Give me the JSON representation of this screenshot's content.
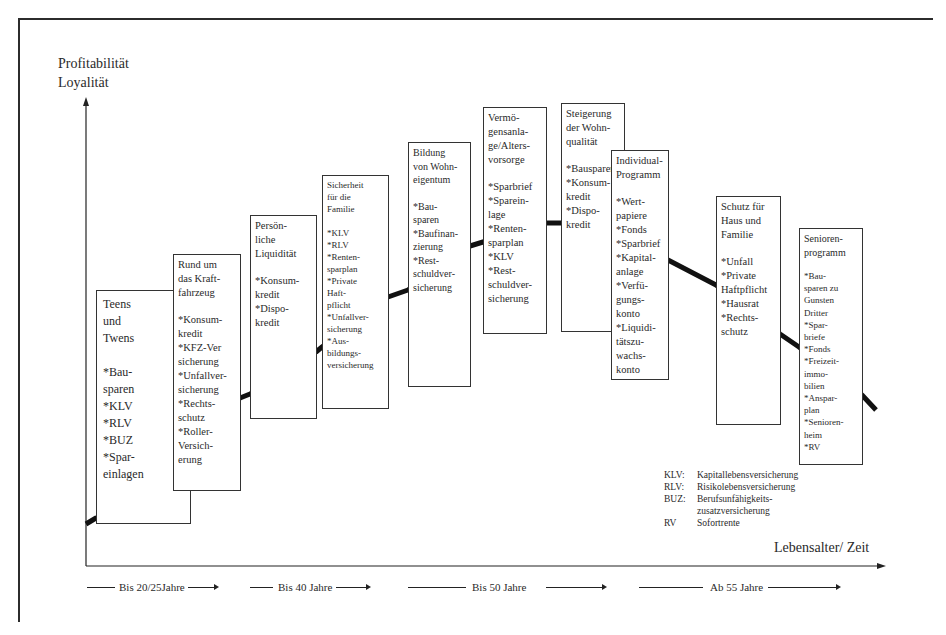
{
  "axes": {
    "y_label_line1": "Profitabilität",
    "y_label_line2": "Loyalität",
    "x_label": "Lebensalter/ Zeit"
  },
  "boxes": [
    {
      "title": "Teens\nund\nTwens",
      "items": [
        "*Bau-\n sparen",
        "*KLV",
        "*RLV",
        "*BUZ",
        "*Spar-\n einlagen"
      ]
    },
    {
      "title": "Rund um\ndas Kraft-\nfahrzeug",
      "items": [
        "*Konsum-\n kredit",
        "*KFZ-Ver\n sicherung",
        "*Unfallver-\n sicherung",
        "*Rechts-\n schutz",
        "*Roller-\n Versich-\n erung"
      ]
    },
    {
      "title": "Persön-\nliche\nLiquidität",
      "items": [
        "*Konsum-\n kredit",
        "*Dispo-\n kredit"
      ]
    },
    {
      "title": "Sicherheit\nfür die\nFamilie",
      "items": [
        "*KLV",
        "*RLV",
        "*Renten-\n sparplan",
        "*Private\n Haft-\n pflicht",
        "*Unfallver-\n sicherung",
        "*Aus-\n bildungs-\n versicherung"
      ]
    },
    {
      "title": "Bildung\nvon Wohn-\neigentum",
      "items": [
        "*Bau-\n sparen",
        "*Baufinan-\n zierung",
        "*Rest-\n schuldver-\n sicherung"
      ]
    },
    {
      "title": "Vermö-\ngensanla-\nge/Alters-\nvorsorge",
      "items": [
        "*Sparbrief",
        "*Sparein-\n lage",
        "*Renten-\n sparplan",
        "*KLV",
        "*Rest-\n schuldver-\n sicherung"
      ]
    },
    {
      "title": "Steigerung\nder Wohn-\nqualität",
      "items": [
        "*Bausparen",
        "*Konsum-\n kredit",
        "*Dispo-\n kredit"
      ]
    },
    {
      "title": "Individual-\nProgramm",
      "items": [
        "*Wert-\n papiere",
        "*Fonds",
        "*Sparbrief",
        "*Kapital-\n anlage",
        "*Verfü-\n gungs-\n konto",
        "*Liquidi-\n tätszu-\n wachs-\n konto"
      ]
    },
    {
      "title": "Schutz für\nHaus und\nFamilie",
      "items": [
        "*Unfall",
        "*Private\n Haftpflicht",
        "*Hausrat",
        "*Rechts-\n schutz"
      ]
    },
    {
      "title": "Senioren-\nprogramm",
      "items": [
        "*Bau-\n sparen zu\n Gunsten\n Dritter",
        "*Spar-\n briefe",
        "*Fonds",
        "*Freizeit-\n immo-\n bilien",
        "*Anspar-\n plan",
        "*Senioren-\n heim",
        "*RV"
      ]
    }
  ],
  "legend": [
    {
      "abbr": "KLV:",
      "definition": "Kapitallebensversicherung"
    },
    {
      "abbr": "RLV:",
      "definition": "Risikolebensversicherung"
    },
    {
      "abbr": "BUZ:",
      "definition": "Berufsunfähigkeits-\n  zusatzversicherung"
    },
    {
      "abbr": "RV",
      "definition": "Sofortrente"
    }
  ],
  "phases": [
    {
      "label": "Bis 20/25Jahre"
    },
    {
      "label": "Bis 40 Jahre"
    },
    {
      "label": "Bis 50 Jahre"
    },
    {
      "label": "Ab 55 Jahre"
    }
  ],
  "colors": {
    "line": "#111111",
    "border": "#333333",
    "background": "#ffffff"
  }
}
